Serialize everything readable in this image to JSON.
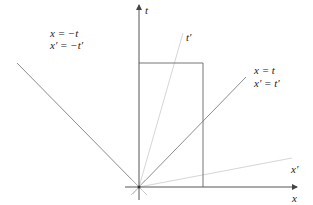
{
  "diagram": {
    "axes": {
      "t_label": "t",
      "x_label": "x"
    },
    "lines": {
      "t_prime_label": "t′",
      "x_prime_label": "x′"
    },
    "annotations": {
      "left_line1": "x = −t",
      "left_line2": "x′ = −t′",
      "right_line1": "x = t",
      "right_line2": "x′ = t′"
    },
    "colors": {
      "axis": "#555555",
      "light_cone": "#8c8c8c",
      "primed_axes": "#d0d0d0",
      "rectangle": "#777777"
    }
  }
}
